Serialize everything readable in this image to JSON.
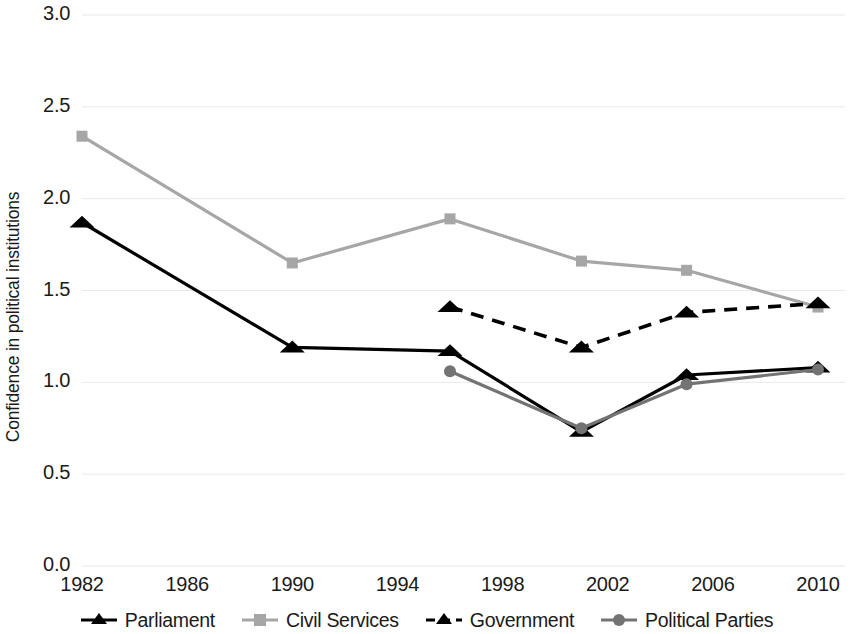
{
  "chart_data": {
    "type": "line",
    "title": "",
    "xlabel": "",
    "ylabel": "Confidence in political institutions",
    "xlim": [
      1982,
      2010
    ],
    "ylim": [
      0.0,
      3.0
    ],
    "grid": true,
    "legend_position": "bottom",
    "y_ticks": [
      "0.0",
      "0.5",
      "1.0",
      "1.5",
      "2.0",
      "2.5",
      "3.0"
    ],
    "y_tick_values": [
      0.0,
      0.5,
      1.0,
      1.5,
      2.0,
      2.5,
      3.0
    ],
    "x_ticks": [
      "1982",
      "1986",
      "1990",
      "1994",
      "1998",
      "2002",
      "2006",
      "2010"
    ],
    "x_tick_values": [
      1982,
      1986,
      1990,
      1994,
      1998,
      2002,
      2006,
      2010
    ],
    "series": [
      {
        "name": "Parliament",
        "color": "#000000",
        "marker": "triangle",
        "dash": "solid",
        "x": [
          1982,
          1990,
          1996,
          2001,
          2005,
          2010
        ],
        "values": [
          1.87,
          1.19,
          1.17,
          0.73,
          1.04,
          1.08
        ]
      },
      {
        "name": "Civil Services",
        "color": "#a6a6a6",
        "marker": "square",
        "dash": "solid",
        "x": [
          1982,
          1990,
          1996,
          2001,
          2005,
          2010
        ],
        "values": [
          2.34,
          1.65,
          1.89,
          1.66,
          1.61,
          1.41
        ]
      },
      {
        "name": "Government",
        "color": "#000000",
        "marker": "triangle",
        "dash": "dashed",
        "x": [
          1996,
          2001,
          2005,
          2010
        ],
        "values": [
          1.41,
          1.19,
          1.38,
          1.43
        ]
      },
      {
        "name": "Political Parties",
        "color": "#737373",
        "marker": "circle",
        "dash": "solid",
        "x": [
          1996,
          2001,
          2005,
          2010
        ],
        "values": [
          1.06,
          0.75,
          0.99,
          1.07
        ]
      }
    ]
  },
  "legend": {
    "items": [
      {
        "label": "Parliament"
      },
      {
        "label": "Civil Services"
      },
      {
        "label": "Government"
      },
      {
        "label": "Political Parties"
      }
    ]
  }
}
